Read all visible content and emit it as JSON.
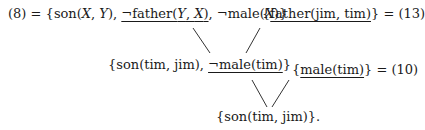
{
  "diagram": {
    "type": "resolution-tree",
    "top_left": {
      "label": "(8) =",
      "open": "{",
      "lit1": "son(",
      "lit1_args": [
        "X",
        "Y"
      ],
      "lit2": "¬father(",
      "lit2_args": [
        "Y",
        "X"
      ],
      "lit3": "¬male(",
      "lit3_args": [
        "X"
      ],
      "close": "}",
      "underlined": "¬father(Y, X)"
    },
    "top_right": {
      "open": "{",
      "lit": "father(jim, tim)",
      "close": "}",
      "suffix": "= (13)",
      "underlined": "father(jim, tim)"
    },
    "middle_left": {
      "open": "{",
      "lit1": "son(tim, jim),",
      "lit2": "¬male(tim)",
      "close": "}",
      "underlined": "¬male(tim)"
    },
    "middle_right": {
      "open": "{",
      "lit": "male(tim)",
      "close": "}",
      "suffix": "= (10)",
      "underlined": "male(tim)"
    },
    "bottom": {
      "text": "{son(tim, jim)}."
    },
    "separators": {
      "comma": ",",
      "rparen": ")",
      "comma_space": ", "
    }
  }
}
